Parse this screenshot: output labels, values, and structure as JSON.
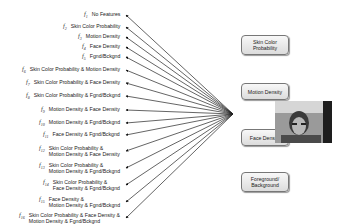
{
  "features": [
    {
      "fn": "f1",
      "lines": [
        "No Features"
      ]
    },
    {
      "fn": "f2",
      "lines": [
        "Skin Color Probability"
      ]
    },
    {
      "fn": "f3",
      "lines": [
        "Motion Density"
      ]
    },
    {
      "fn": "f4",
      "lines": [
        "Face Density"
      ]
    },
    {
      "fn": "f5",
      "lines": [
        "Fgnd/Bckgnd"
      ]
    },
    {
      "fn": "f6",
      "lines": [
        "Skin Color Probability & Motion Density"
      ]
    },
    {
      "fn": "f7",
      "lines": [
        "Skin Color Probability & Face Density"
      ]
    },
    {
      "fn": "f8",
      "lines": [
        "Skin Color Probability & Fgnd/Bckgnd"
      ]
    },
    {
      "fn": "f9",
      "lines": [
        "Motion Density & Face Density"
      ]
    },
    {
      "fn": "f10",
      "lines": [
        "Motion Density & Fgnd/Bckgnd"
      ]
    },
    {
      "fn": "f11",
      "lines": [
        "Face Density & Fgnd/Bckgnd"
      ]
    },
    {
      "fn": "f12",
      "lines": [
        "Skin Color Probability &",
        "Motion Density & Face Density"
      ]
    },
    {
      "fn": "f13",
      "lines": [
        "Skin Color Probability &",
        "Motion Density & Fgnd/Bckgnd"
      ]
    },
    {
      "fn": "f14",
      "lines": [
        "Skin Color Probability &",
        "Face Density & Fgnd/Bckgnd"
      ]
    },
    {
      "fn": "f15",
      "lines": [
        "Face Density &",
        "Motion Density & Fgnd/Bckgnd"
      ]
    },
    {
      "fn": "f16",
      "lines": [
        "Skin Color Probability & Face Density &",
        "Motion Density & Fgnd/Bckgnd"
      ]
    }
  ],
  "boxes": [
    {
      "id": "skin",
      "lines": [
        "Skin Color",
        "Probability"
      ]
    },
    {
      "id": "motion",
      "lines": [
        "Motion Density"
      ]
    },
    {
      "id": "face",
      "lines": [
        "Face Density"
      ]
    },
    {
      "id": "fgbg",
      "lines": [
        "Foreground/",
        "Background"
      ]
    }
  ],
  "image": {
    "description": "video frame of a person's face"
  }
}
